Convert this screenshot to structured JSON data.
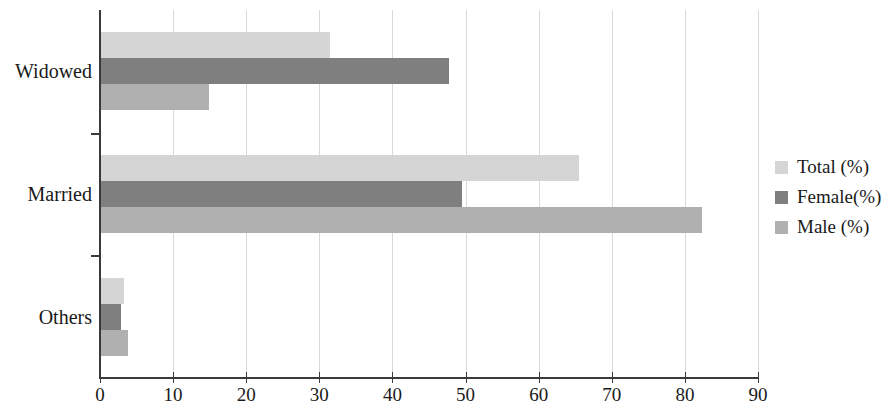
{
  "chart_data": {
    "type": "bar",
    "orientation": "horizontal",
    "title": "",
    "xlabel": "",
    "ylabel": "",
    "categories": [
      "Widowed",
      "Married",
      "Others"
    ],
    "xlim": [
      0,
      90
    ],
    "xticks": [
      0,
      10,
      20,
      30,
      40,
      50,
      60,
      70,
      80,
      90
    ],
    "xtick_labels": [
      "0",
      "10",
      "20",
      "30",
      "40",
      "50",
      "60",
      "70",
      "80",
      "90"
    ],
    "grid": true,
    "grid_axis": "x",
    "legend_position": "right",
    "series": [
      {
        "name": "Total (%)",
        "color": "#d5d5d5",
        "values": [
          31.5,
          65.5,
          3.3
        ]
      },
      {
        "name": "Female(%)",
        "color": "#7f7f7f",
        "values": [
          47.7,
          49.5,
          2.9
        ]
      },
      {
        "name": "Male (%)",
        "color": "#b0b0b0",
        "values": [
          14.9,
          82.4,
          3.8
        ]
      }
    ]
  }
}
